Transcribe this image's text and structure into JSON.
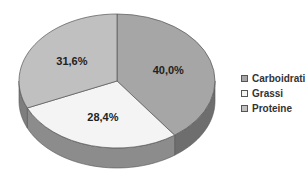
{
  "chart_data": {
    "type": "pie",
    "style": "3d",
    "title": "",
    "categories": [
      "Carboidrati",
      "Grassi",
      "Proteine"
    ],
    "values": [
      40.0,
      28.4,
      31.6
    ],
    "labels": [
      "40,0%",
      "28,4%",
      "31,6%"
    ],
    "colors": [
      "#a6a6a6",
      "#f4f4f4",
      "#c0c0c0"
    ],
    "side_colors": [
      "#6e6e6e",
      "#8c8c8c",
      "#7e7e7e"
    ],
    "start_angle_deg": 0,
    "direction": "clockwise",
    "legend_position": "right",
    "legend": [
      {
        "label": "Carboidrati",
        "color": "#a6a6a6"
      },
      {
        "label": "Grassi",
        "color": "#f4f4f4"
      },
      {
        "label": "Proteine",
        "color": "#c0c0c0"
      }
    ]
  }
}
